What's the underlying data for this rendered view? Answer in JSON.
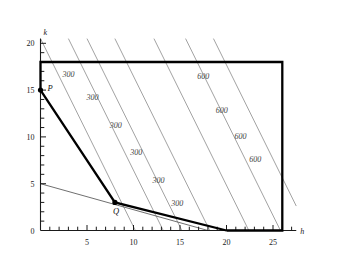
{
  "figure": {
    "background": "#ffffff",
    "axis_color": "#1a1a1a",
    "contour_color": "#8a8a8a",
    "feasible_edge_color": "#000000",
    "budget_line_color": "#555555"
  },
  "axes": {
    "x_name": "h",
    "y_name": "k",
    "x_ticks_major": [
      5,
      10,
      15,
      20,
      25
    ],
    "x_tick_labels": [
      "5",
      "10",
      "15",
      "20",
      "25"
    ],
    "y_ticks_major": [
      0,
      5,
      10,
      15,
      20
    ],
    "y_tick_labels": [
      "0",
      "5",
      "10",
      "15",
      "20"
    ],
    "origin_label": "0",
    "x_min": 0,
    "x_max": 27.5,
    "y_min": 0,
    "y_max": 20.5,
    "minor_tick_step": 1
  },
  "points": [
    {
      "id": "P",
      "label": "P",
      "h": 0,
      "k": 15,
      "label_dx": 7,
      "label_dy": 1
    },
    {
      "id": "Q",
      "label": "Q",
      "h": 8,
      "k": 3,
      "label_dx": -2,
      "label_dy": 12
    }
  ],
  "chart_data": {
    "type": "line",
    "title": "",
    "xlabel": "h",
    "ylabel": "k",
    "xlim": [
      0,
      27.5
    ],
    "ylim": [
      0,
      20.5
    ],
    "grid": false,
    "legend": "none",
    "series": [
      {
        "name": "feasible-region-boundary",
        "style": "thick-black",
        "points": [
          [
            0,
            15
          ],
          [
            0,
            18
          ],
          [
            26,
            18
          ],
          [
            26,
            0
          ],
          [
            20,
            0
          ]
        ]
      },
      {
        "name": "production-frontier",
        "style": "thick-black",
        "points": [
          [
            0,
            15
          ],
          [
            8,
            3
          ],
          [
            20,
            0
          ]
        ]
      },
      {
        "name": "budget-line",
        "style": "thin-grey",
        "points": [
          [
            0,
            5
          ],
          [
            18,
            0
          ]
        ]
      },
      {
        "name": "contour-300-a",
        "style": "thin-grey",
        "value": 300,
        "points": [
          [
            0,
            20.5
          ],
          [
            10.2,
            0
          ]
        ]
      },
      {
        "name": "contour-300-b",
        "style": "thin-grey",
        "value": 300,
        "points": [
          [
            3.0,
            20.5
          ],
          [
            13.2,
            0
          ]
        ]
      },
      {
        "name": "contour-300-c",
        "style": "thin-grey",
        "value": 300,
        "points": [
          [
            5.0,
            20.5
          ],
          [
            15.2,
            0
          ]
        ]
      },
      {
        "name": "contour-300-d",
        "style": "thin-grey",
        "value": 300,
        "points": [
          [
            8.0,
            20.5
          ],
          [
            18.2,
            0
          ]
        ]
      },
      {
        "name": "contour-600-a",
        "style": "thin-grey",
        "value": 600,
        "points": [
          [
            12.2,
            20.5
          ],
          [
            22.4,
            0
          ]
        ]
      },
      {
        "name": "contour-600-b",
        "style": "thin-grey",
        "value": 600,
        "points": [
          [
            15.6,
            20.5
          ],
          [
            25.8,
            0
          ]
        ]
      },
      {
        "name": "contour-600-c",
        "style": "thin-grey",
        "value": 600,
        "points": [
          [
            18.6,
            20.5
          ],
          [
            28.8,
            0
          ]
        ]
      }
    ],
    "contour_labels": [
      {
        "text": "300",
        "h": 3.0,
        "k": 16.4
      },
      {
        "text": "300",
        "h": 5.6,
        "k": 13.9
      },
      {
        "text": "300",
        "h": 8.1,
        "k": 10.9
      },
      {
        "text": "300",
        "h": 10.3,
        "k": 8.1
      },
      {
        "text": "300",
        "h": 12.7,
        "k": 5.1
      },
      {
        "text": "300",
        "h": 14.7,
        "k": 2.6
      },
      {
        "text": "600",
        "h": 17.5,
        "k": 16.2
      },
      {
        "text": "600",
        "h": 19.5,
        "k": 12.6
      },
      {
        "text": "600",
        "h": 21.5,
        "k": 9.8
      },
      {
        "text": "600",
        "h": 23.1,
        "k": 7.3
      }
    ]
  }
}
